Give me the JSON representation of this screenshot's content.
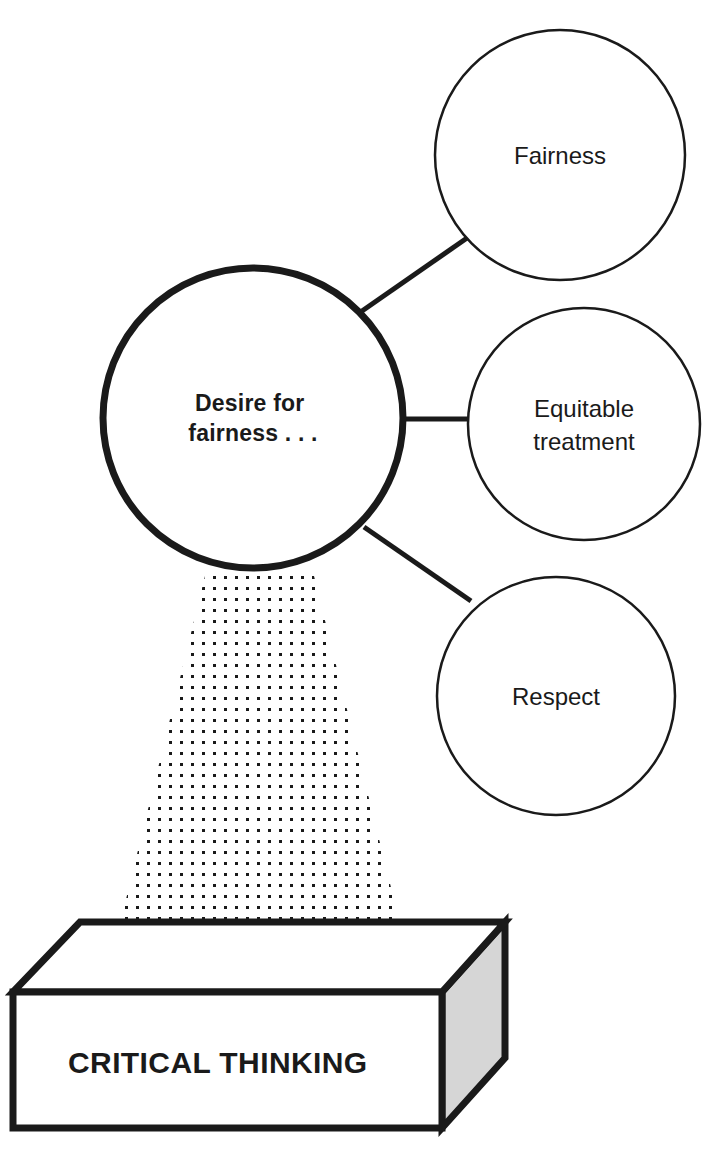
{
  "diagram": {
    "core_node": {
      "id": "core",
      "line1": "Desire for",
      "line2": "fairness . . .",
      "shape": "circle",
      "cx": 253,
      "cy": 418,
      "r": 150,
      "stroke_width": 7,
      "stroke_color": "#1a1a1a",
      "fill_color": "#ffffff"
    },
    "branch_nodes": [
      {
        "id": "fairness",
        "lines": [
          "Fairness"
        ],
        "shape": "circle",
        "cx": 560,
        "cy": 155,
        "r": 125,
        "stroke_width": 2.5,
        "stroke_color": "#1a1a1a",
        "fill_color": "#ffffff"
      },
      {
        "id": "equitable-treatment",
        "lines": [
          "Equitable",
          "treatment"
        ],
        "shape": "circle",
        "cx": 584,
        "cy": 424,
        "r": 116,
        "stroke_width": 2.5,
        "stroke_color": "#1a1a1a",
        "fill_color": "#ffffff"
      },
      {
        "id": "respect",
        "lines": [
          "Respect"
        ],
        "shape": "circle",
        "cx": 556,
        "cy": 696,
        "r": 119,
        "stroke_width": 2.5,
        "stroke_color": "#1a1a1a",
        "fill_color": "#ffffff"
      }
    ],
    "connectors": [
      {
        "id": "core-to-fairness",
        "x1": 362,
        "y1": 311,
        "x2": 467,
        "y2": 238,
        "width": 5
      },
      {
        "id": "core-to-equitable",
        "x1": 399,
        "y1": 419,
        "x2": 470,
        "y2": 419,
        "width": 5
      },
      {
        "id": "core-to-respect",
        "x1": 364,
        "y1": 527,
        "x2": 471,
        "y2": 601,
        "width": 5
      }
    ],
    "beam": {
      "id": "dotted-beam",
      "description": "dotted light beam from core circle to base platform",
      "top_left_x": 206,
      "top_right_x": 313,
      "top_y": 572,
      "bottom_left_x": 118,
      "bottom_right_x": 402,
      "bottom_y": 932,
      "dot_spacing": 11,
      "dot_size": 3,
      "dot_color": "#1a1a1a"
    },
    "base": {
      "id": "critical-thinking-platform",
      "label": "CRITICAL THINKING",
      "shape": "3d-box",
      "front_face": {
        "left": 13,
        "right": 442,
        "top": 992,
        "bottom": 1128
      },
      "top_face": {
        "back_left_x": 80,
        "back_right_x": 505,
        "back_y": 922
      },
      "side_face_fill": "#d6d6d6",
      "front_face_fill": "#ffffff",
      "top_face_fill": "#ffffff",
      "stroke_color": "#1a1a1a",
      "stroke_width": 7,
      "label_x": 68,
      "label_baseline_y": 1073
    },
    "colors": {
      "ink": "#1a1a1a",
      "paper": "#ffffff",
      "side_gray": "#d6d6d6"
    }
  }
}
